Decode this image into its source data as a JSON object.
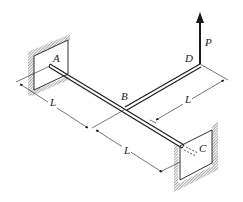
{
  "figure": {
    "type": "3D structural mechanics sketch: T-shaped shaft fixed at both ends with load at cantilever tip",
    "labels": {
      "A": "A",
      "B": "B",
      "C": "C",
      "D": "D",
      "P": "P"
    },
    "dimensions": {
      "AB": "L",
      "BC": "L",
      "BD": "L"
    },
    "colors": {
      "line": "#1a1a1a",
      "hatch": "#8a8a8a",
      "background": "#ffffff"
    }
  }
}
